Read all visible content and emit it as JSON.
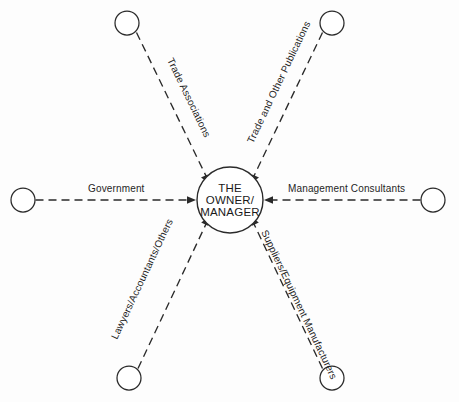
{
  "diagram": {
    "type": "hub-and-spoke",
    "hub": {
      "name": "the-owner-manager",
      "lines": [
        "THE",
        "OWNER/",
        "MANAGER"
      ],
      "line1": "THE",
      "line2": "OWNER/",
      "line3": "MANAGER",
      "center_x": 230,
      "center_y": 200,
      "radius": 33
    },
    "colors": {
      "stroke": "#2a2a2a",
      "text": "#1a1a1a",
      "background": "#ffffff"
    },
    "nodes": [
      {
        "id": "trade-associations",
        "label": "Trade Associations",
        "circle_x": 127,
        "circle_y": 23,
        "radius": 12,
        "direction": "upper-left"
      },
      {
        "id": "trade-and-other-publications",
        "label": "Trade and Other Publications",
        "circle_x": 332,
        "circle_y": 23,
        "radius": 12,
        "direction": "upper-right"
      },
      {
        "id": "government",
        "label": "Government",
        "circle_x": 23,
        "circle_y": 200,
        "radius": 12,
        "direction": "left"
      },
      {
        "id": "management-consultants",
        "label": "Management Consultants",
        "circle_x": 433,
        "circle_y": 200,
        "radius": 12,
        "direction": "right"
      },
      {
        "id": "lawyers-accountants-others",
        "label": "Lawyers/Accountants/Others",
        "circle_x": 129,
        "circle_y": 378,
        "radius": 12,
        "direction": "lower-left"
      },
      {
        "id": "suppliers-equipment-manufacturers",
        "label": "Suppliers/Equipment Manufacturers",
        "circle_x": 332,
        "circle_y": 378,
        "radius": 12,
        "direction": "lower-right"
      }
    ]
  }
}
